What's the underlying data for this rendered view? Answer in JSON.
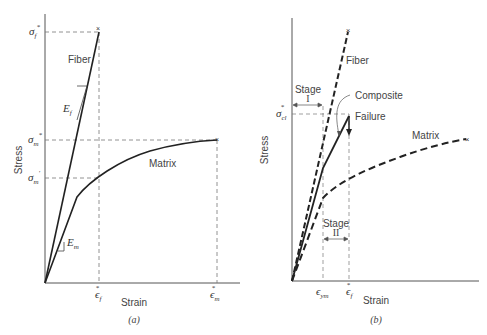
{
  "panel_a": {
    "caption": "(a)",
    "ylabel": "Stress",
    "xlabel": "Strain",
    "curves": {
      "fiber": "Fiber",
      "matrix": "Matrix"
    },
    "y_ticks": {
      "sigma_f_star": "σ",
      "sigma_f_star_sub": "f",
      "sigma_m_star": "σ",
      "sigma_m_star_sub": "m",
      "sigma_m_prime": "σ",
      "sigma_m_prime_sub": "m"
    },
    "x_ticks": {
      "eps_f_star": "ϵ",
      "eps_f_star_sub": "f",
      "eps_m_star": "ϵ",
      "eps_m_star_sub": "m"
    },
    "slopes": {
      "Ef": "E",
      "Ef_sub": "f",
      "Em": "E",
      "Em_sub": "m"
    },
    "star": "*",
    "prime": "′"
  },
  "panel_b": {
    "caption": "(b)",
    "ylabel": "Stress",
    "xlabel": "Strain",
    "curves": {
      "fiber": "Fiber",
      "matrix": "Matrix",
      "composite": "Composite"
    },
    "annotations": {
      "failure": "Failure",
      "stage1": "Stage",
      "stage1_num": "I",
      "stage2": "Stage",
      "stage2_num": "II"
    },
    "y_ticks": {
      "sigma_cl_star": "σ",
      "sigma_cl_star_sub": "cl"
    },
    "x_ticks": {
      "eps_ym": "ϵ",
      "eps_ym_sub": "ym",
      "eps_f_star": "ϵ",
      "eps_f_star_sub": "f"
    },
    "star": "*",
    "fail_mark": "×"
  }
}
